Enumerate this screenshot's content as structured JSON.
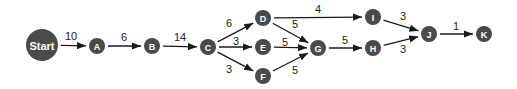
{
  "diagram": {
    "nodes": [
      {
        "id": "Start",
        "label": "Start",
        "x": 42,
        "y": 45,
        "r": 16
      },
      {
        "id": "A",
        "label": "A",
        "x": 97,
        "y": 46,
        "r": 8
      },
      {
        "id": "B",
        "label": "B",
        "x": 152,
        "y": 46,
        "r": 8
      },
      {
        "id": "C",
        "label": "C",
        "x": 208,
        "y": 47,
        "r": 8
      },
      {
        "id": "D",
        "label": "D",
        "x": 263,
        "y": 18,
        "r": 8
      },
      {
        "id": "E",
        "label": "E",
        "x": 263,
        "y": 47,
        "r": 8
      },
      {
        "id": "F",
        "label": "F",
        "x": 263,
        "y": 76,
        "r": 8
      },
      {
        "id": "G",
        "label": "G",
        "x": 318,
        "y": 48,
        "r": 8
      },
      {
        "id": "I",
        "label": "I",
        "x": 373,
        "y": 17,
        "r": 8
      },
      {
        "id": "H",
        "label": "H",
        "x": 373,
        "y": 48,
        "r": 8
      },
      {
        "id": "J",
        "label": "J",
        "x": 429,
        "y": 34,
        "r": 8
      },
      {
        "id": "K",
        "label": "K",
        "x": 484,
        "y": 34,
        "r": 8
      }
    ],
    "edges": [
      {
        "from": "Start",
        "to": "A",
        "weight": "10",
        "lx": 71,
        "ly": 40
      },
      {
        "from": "A",
        "to": "B",
        "weight": "6",
        "lx": 124,
        "ly": 41
      },
      {
        "from": "B",
        "to": "C",
        "weight": "14",
        "lx": 180,
        "ly": 41
      },
      {
        "from": "C",
        "to": "D",
        "weight": "6",
        "lx": 229,
        "ly": 27
      },
      {
        "from": "C",
        "to": "E",
        "weight": "3",
        "lx": 236,
        "ly": 45
      },
      {
        "from": "C",
        "to": "F",
        "weight": "3",
        "lx": 229,
        "ly": 73
      },
      {
        "from": "D",
        "to": "I",
        "weight": "4",
        "lx": 318,
        "ly": 13
      },
      {
        "from": "D",
        "to": "G",
        "weight": "5",
        "lx": 295,
        "ly": 28
      },
      {
        "from": "E",
        "to": "G",
        "weight": "5",
        "lx": 285,
        "ly": 46
      },
      {
        "from": "F",
        "to": "G",
        "weight": "5",
        "lx": 295,
        "ly": 74
      },
      {
        "from": "G",
        "to": "H",
        "weight": "5",
        "lx": 345,
        "ly": 44
      },
      {
        "from": "I",
        "to": "J",
        "weight": "3",
        "lx": 403,
        "ly": 20
      },
      {
        "from": "H",
        "to": "J",
        "weight": "3",
        "lx": 403,
        "ly": 53
      },
      {
        "from": "J",
        "to": "K",
        "weight": "1",
        "lx": 456,
        "ly": 30
      }
    ]
  }
}
